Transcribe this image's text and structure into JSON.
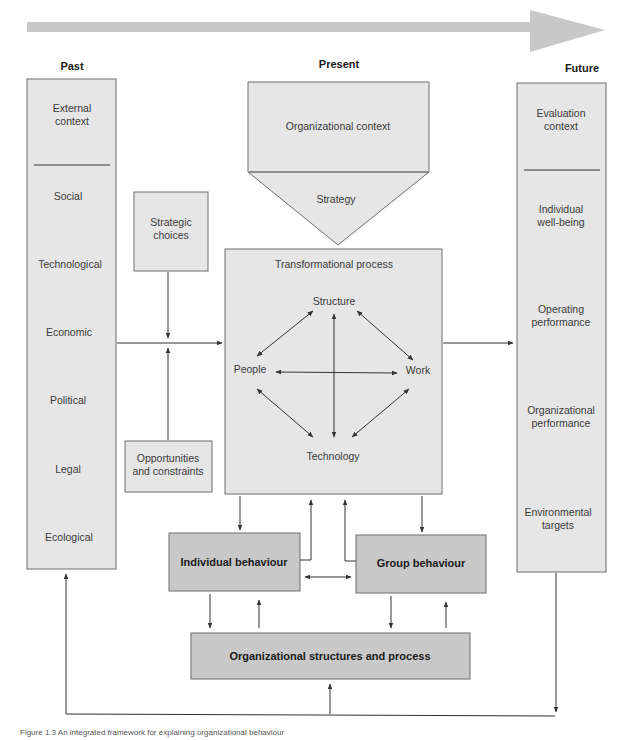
{
  "timeline": {
    "past": "Past",
    "present": "Present",
    "future": "Future",
    "arrow_color": "#c8c8c8"
  },
  "past_column": {
    "title_line1": "External",
    "title_line2": "context",
    "items": [
      "Social",
      "Technological",
      "Economic",
      "Political",
      "Legal",
      "Ecological"
    ]
  },
  "strategic_choices": {
    "line1": "Strategic",
    "line2": "choices"
  },
  "opportunities": {
    "line1": "Opportunities",
    "line2": "and constraints"
  },
  "present_block": {
    "organizational_context": "Organizational context",
    "strategy": "Strategy"
  },
  "transformational_process": {
    "title": "Transformational process",
    "structure": "Structure",
    "people": "People",
    "work": "Work",
    "technology": "Technology"
  },
  "future_column": {
    "title_line1": "Evaluation",
    "title_line2": "context",
    "items": [
      {
        "line1": "Individual",
        "line2": "well-being"
      },
      {
        "line1": "Operating",
        "line2": "performance"
      },
      {
        "line1": "Organizational",
        "line2": "performance"
      },
      {
        "line1": "Environmental",
        "line2": "targets"
      }
    ]
  },
  "behaviour": {
    "individual": "Individual behaviour",
    "group": "Group behaviour",
    "org_structures": "Organizational structures and process"
  },
  "colors": {
    "light_box": "#e6e6e6",
    "dark_box": "#c8c8c8",
    "border": "#6e6e6e",
    "line": "#333333"
  },
  "caption": "Figure 1.3 An integrated framework for explaining organizational behaviour"
}
